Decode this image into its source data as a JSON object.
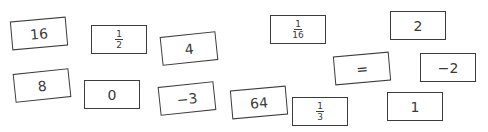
{
  "cards": [
    {
      "id": "16",
      "label": "16",
      "type": "number",
      "x": 11,
      "y": 19,
      "rot": -5
    },
    {
      "id": "half",
      "label": "1/2",
      "type": "fraction",
      "num": "1",
      "den": "2",
      "x": 91,
      "y": 25,
      "rot": 0
    },
    {
      "id": "4",
      "label": "4",
      "type": "number",
      "x": 161,
      "y": 34,
      "rot": -6
    },
    {
      "id": "8",
      "label": "8",
      "type": "number",
      "x": 14,
      "y": 71,
      "rot": -6
    },
    {
      "id": "0",
      "label": "0",
      "type": "number",
      "x": 84,
      "y": 80,
      "rot": 0
    },
    {
      "id": "neg3",
      "label": "−3",
      "type": "number",
      "x": 159,
      "y": 84,
      "rot": -6
    },
    {
      "id": "64",
      "label": "64",
      "type": "number",
      "x": 231,
      "y": 88,
      "rot": -5
    },
    {
      "id": "sixteenth",
      "label": "1/16",
      "type": "fraction",
      "num": "1",
      "den": "16",
      "x": 270,
      "y": 15,
      "rot": 0
    },
    {
      "id": "equals",
      "label": "=",
      "type": "symbol",
      "x": 334,
      "y": 54,
      "rot": -5
    },
    {
      "id": "2",
      "label": "2",
      "type": "number",
      "x": 390,
      "y": 11,
      "rot": 0
    },
    {
      "id": "neg2",
      "label": "−2",
      "type": "number",
      "x": 420,
      "y": 53,
      "rot": 0
    },
    {
      "id": "third",
      "label": "1/3",
      "type": "fraction",
      "num": "1",
      "den": "3",
      "x": 292,
      "y": 97,
      "rot": 0
    },
    {
      "id": "1",
      "label": "1",
      "type": "number",
      "x": 387,
      "y": 92,
      "rot": 0
    }
  ]
}
